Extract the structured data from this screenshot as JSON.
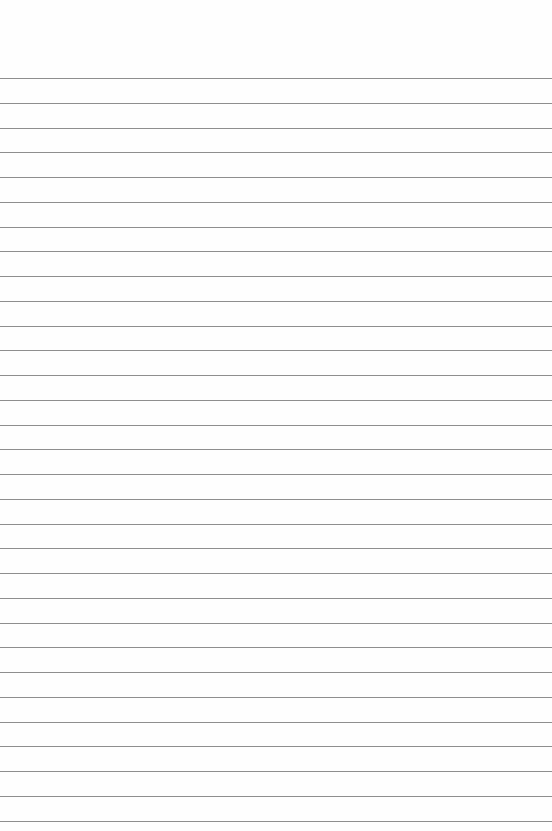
{
  "paper": {
    "type": "lined-paper",
    "background_color": "#fefefe",
    "line_color": "#8e8e8e",
    "first_line_y": 78,
    "line_spacing": 24.75,
    "line_count": 31
  }
}
